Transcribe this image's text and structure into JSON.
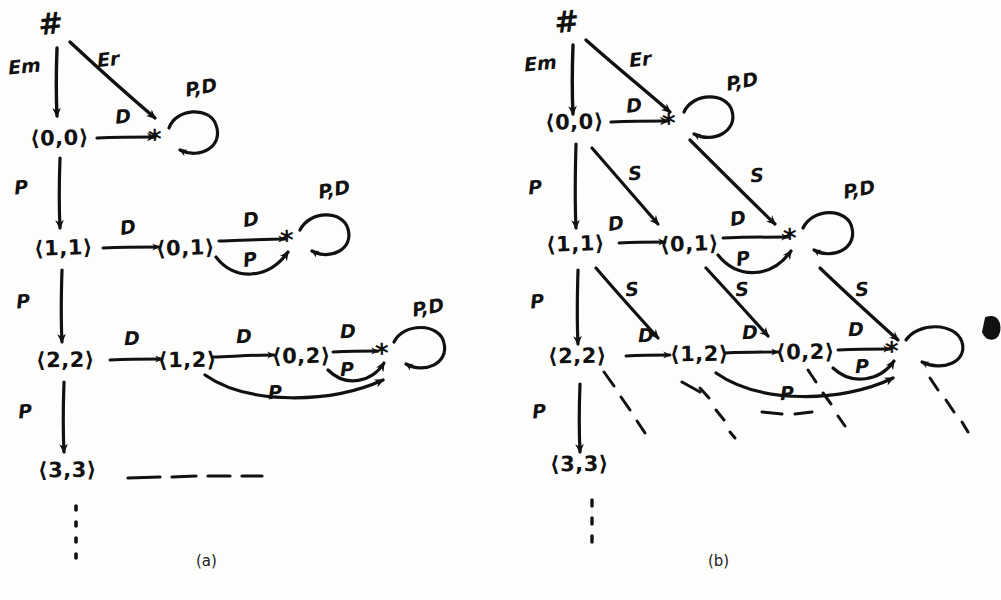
{
  "figure": {
    "ink_color": "#111111",
    "background_color": "#fdfdfc",
    "panels": [
      {
        "id": "a",
        "caption": "(a)"
      },
      {
        "id": "b",
        "caption": "(b)"
      }
    ]
  },
  "panel_a": {
    "caption": "(a)",
    "start_symbol": "#",
    "nodes": [
      {
        "id": "a-00",
        "label": "⟨0,0⟩"
      },
      {
        "id": "a-11",
        "label": "⟨1,1⟩"
      },
      {
        "id": "a-01",
        "label": "⟨0,1⟩"
      },
      {
        "id": "a-22",
        "label": "⟨2,2⟩"
      },
      {
        "id": "a-12",
        "label": "⟨1,2⟩"
      },
      {
        "id": "a-02",
        "label": "⟨0,2⟩"
      },
      {
        "id": "a-33",
        "label": "⟨3,3⟩"
      },
      {
        "id": "a-star1",
        "label": "*"
      },
      {
        "id": "a-star2",
        "label": "*"
      },
      {
        "id": "a-star3",
        "label": "*"
      }
    ],
    "edge_labels": {
      "em": "Em",
      "er": "Er",
      "d": "D",
      "p": "P",
      "pd_loop": "P,D"
    },
    "edges": [
      {
        "from": "#",
        "to": "a-00",
        "label": "Em"
      },
      {
        "from": "#",
        "to": "a-star1",
        "label": "Er"
      },
      {
        "from": "a-00",
        "to": "a-star1",
        "label": "D"
      },
      {
        "from": "a-star1",
        "to": "a-star1",
        "label": "P,D"
      },
      {
        "from": "a-00",
        "to": "a-11",
        "label": "P"
      },
      {
        "from": "a-11",
        "to": "a-01",
        "label": "D"
      },
      {
        "from": "a-01",
        "to": "a-star2",
        "label": "D"
      },
      {
        "from": "a-01",
        "to": "a-star2",
        "label": "P"
      },
      {
        "from": "a-star2",
        "to": "a-star2",
        "label": "P,D"
      },
      {
        "from": "a-11",
        "to": "a-22",
        "label": "P"
      },
      {
        "from": "a-22",
        "to": "a-12",
        "label": "D"
      },
      {
        "from": "a-12",
        "to": "a-02",
        "label": "D"
      },
      {
        "from": "a-02",
        "to": "a-star3",
        "label": "D"
      },
      {
        "from": "a-02",
        "to": "a-star3",
        "label": "P"
      },
      {
        "from": "a-12",
        "to": "a-star3",
        "label": "P"
      },
      {
        "from": "a-star3",
        "to": "a-star3",
        "label": "P,D"
      },
      {
        "from": "a-22",
        "to": "a-33",
        "label": "P"
      }
    ],
    "continuation": {
      "horizontal_dashes": "- - - -",
      "vertical_dots": "⋮"
    }
  },
  "panel_b": {
    "caption": "(b)",
    "start_symbol": "#",
    "nodes": [
      {
        "id": "b-00",
        "label": "⟨0,0⟩"
      },
      {
        "id": "b-11",
        "label": "⟨1,1⟩"
      },
      {
        "id": "b-01",
        "label": "⟨0,1⟩"
      },
      {
        "id": "b-22",
        "label": "⟨2,2⟩"
      },
      {
        "id": "b-12",
        "label": "⟨1,2⟩"
      },
      {
        "id": "b-02",
        "label": "⟨0,2⟩"
      },
      {
        "id": "b-33",
        "label": "⟨3,3⟩"
      },
      {
        "id": "b-star1",
        "label": "*"
      },
      {
        "id": "b-star2",
        "label": "*"
      },
      {
        "id": "b-star3",
        "label": "*"
      }
    ],
    "edge_labels": {
      "em": "Em",
      "er": "Er",
      "d": "D",
      "p": "P",
      "s": "S",
      "pd_loop": "P,D"
    },
    "edges": [
      {
        "from": "#",
        "to": "b-00",
        "label": "Em"
      },
      {
        "from": "#",
        "to": "b-star1",
        "label": "Er"
      },
      {
        "from": "b-00",
        "to": "b-star1",
        "label": "D"
      },
      {
        "from": "b-star1",
        "to": "b-star1",
        "label": "P,D"
      },
      {
        "from": "b-00",
        "to": "b-11",
        "label": "P"
      },
      {
        "from": "b-00",
        "to": "b-01",
        "label": "S"
      },
      {
        "from": "b-star1",
        "to": "b-star2",
        "label": "S"
      },
      {
        "from": "b-11",
        "to": "b-01",
        "label": "D"
      },
      {
        "from": "b-01",
        "to": "b-star2",
        "label": "D"
      },
      {
        "from": "b-01",
        "to": "b-star2",
        "label": "P"
      },
      {
        "from": "b-star2",
        "to": "b-star2",
        "label": "P,D"
      },
      {
        "from": "b-11",
        "to": "b-22",
        "label": "P"
      },
      {
        "from": "b-11",
        "to": "b-12",
        "label": "S"
      },
      {
        "from": "b-01",
        "to": "b-02",
        "label": "S"
      },
      {
        "from": "b-star2",
        "to": "b-star3",
        "label": "S"
      },
      {
        "from": "b-22",
        "to": "b-12",
        "label": "D"
      },
      {
        "from": "b-12",
        "to": "b-02",
        "label": "D"
      },
      {
        "from": "b-02",
        "to": "b-star3",
        "label": "D"
      },
      {
        "from": "b-02",
        "to": "b-star3",
        "label": "P"
      },
      {
        "from": "b-12",
        "to": "b-star3",
        "label": "P"
      },
      {
        "from": "b-star3",
        "to": "b-star3",
        "label": "P,D"
      },
      {
        "from": "b-22",
        "to": "b-33",
        "label": "P"
      }
    ],
    "continuation": {
      "diagonal_dashes": "dashed diagonals below row 3",
      "vertical_dots": "⋮"
    }
  }
}
